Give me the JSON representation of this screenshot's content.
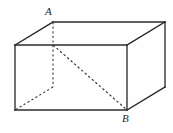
{
  "figure": {
    "kind": "rectangular-box-diagram",
    "background_color": "#fefefe",
    "line_color": "#2b2b2b",
    "hidden_line_color": "#3a3a3a",
    "canvas": {
      "width": 173,
      "height": 133
    },
    "labels": {
      "vertex_a": "A",
      "vertex_b": "B"
    },
    "vertices": {
      "front_top_left": {
        "x": 15,
        "y": 45
      },
      "front_top_right": {
        "x": 127,
        "y": 45
      },
      "front_bottom_right": {
        "x": 127,
        "y": 110
      },
      "front_bottom_left": {
        "x": 15,
        "y": 110
      },
      "back_top_left": {
        "x": 53,
        "y": 22
      },
      "back_top_right": {
        "x": 165,
        "y": 22
      },
      "back_bottom_right": {
        "x": 165,
        "y": 87
      },
      "back_bottom_left": {
        "x": 53,
        "y": 87
      }
    },
    "edges": {
      "solid": [
        {
          "name": "front-top",
          "x1": 15,
          "y1": 45,
          "x2": 127,
          "y2": 45
        },
        {
          "name": "front-right",
          "x1": 127,
          "y1": 45,
          "x2": 127,
          "y2": 110
        },
        {
          "name": "front-bottom",
          "x1": 127,
          "y1": 110,
          "x2": 15,
          "y2": 110
        },
        {
          "name": "front-left",
          "x1": 15,
          "y1": 110,
          "x2": 15,
          "y2": 45
        },
        {
          "name": "top-left-slant",
          "x1": 15,
          "y1": 45,
          "x2": 53,
          "y2": 22
        },
        {
          "name": "top-back",
          "x1": 53,
          "y1": 22,
          "x2": 165,
          "y2": 22
        },
        {
          "name": "top-right-slant",
          "x1": 165,
          "y1": 22,
          "x2": 127,
          "y2": 45
        },
        {
          "name": "back-right-vertical",
          "x1": 165,
          "y1": 22,
          "x2": 165,
          "y2": 87
        },
        {
          "name": "bottom-right-slant",
          "x1": 127,
          "y1": 110,
          "x2": 165,
          "y2": 87
        }
      ],
      "hidden": [
        {
          "name": "back-left-vertical",
          "x1": 53,
          "y1": 22,
          "x2": 53,
          "y2": 87
        },
        {
          "name": "hidden-bottom-left-slant",
          "x1": 53,
          "y1": 87,
          "x2": 15,
          "y2": 110
        }
      ],
      "diagonal": [
        {
          "name": "space-diagonal-A-to-B",
          "x1": 53,
          "y1": 45,
          "x2": 127,
          "y2": 110
        }
      ]
    }
  }
}
